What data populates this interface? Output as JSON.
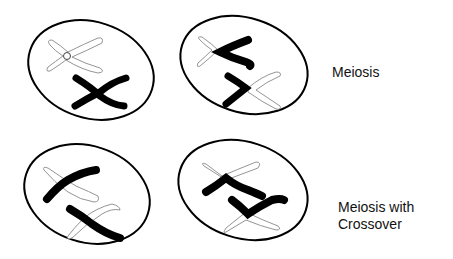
{
  "labels": {
    "meiosis": "Meiosis",
    "crossover_line1": "Meiosis with",
    "crossover_line2": "Crossover"
  },
  "cells": [
    {
      "id": "meiosis-cell-1",
      "row": "Meiosis",
      "description": "outlined X chromosome with centromere circle and black X chromosome"
    },
    {
      "id": "meiosis-cell-2",
      "row": "Meiosis",
      "description": "black and outlined chromatids separating"
    },
    {
      "id": "crossover-cell-1",
      "row": "Meiosis with Crossover",
      "description": "black and outlined chromosomes crossed"
    },
    {
      "id": "crossover-cell-2",
      "row": "Meiosis with Crossover",
      "description": "chromatids with exchanged segments"
    }
  ],
  "colors": {
    "cell_outline": "#000000",
    "chromosome_dark": "#000000",
    "chromosome_light_outline": "#888888"
  }
}
